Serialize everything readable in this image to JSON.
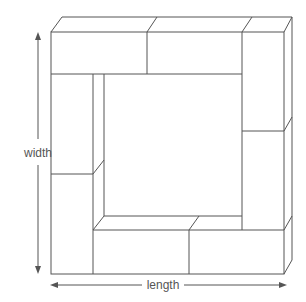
{
  "diagram": {
    "title": "",
    "labels": {
      "width": "width",
      "length": "length"
    },
    "colors": {
      "stroke": "#555555",
      "background": "#ffffff"
    },
    "blocks": [
      {
        "name": "top-left-block"
      },
      {
        "name": "top-middle-block"
      },
      {
        "name": "top-right-block"
      },
      {
        "name": "right-lower-block"
      },
      {
        "name": "bottom-right-block"
      },
      {
        "name": "bottom-left-block"
      },
      {
        "name": "left-lower-block"
      },
      {
        "name": "left-upper-block"
      }
    ]
  }
}
